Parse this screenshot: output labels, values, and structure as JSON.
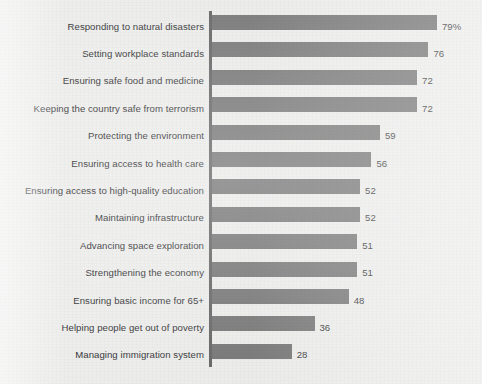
{
  "chart_data": {
    "type": "bar",
    "orientation": "horizontal",
    "title": "",
    "subtitle": "",
    "xlabel": "",
    "ylabel": "",
    "xlim": [
      0,
      79
    ],
    "grid": false,
    "legend": null,
    "value_suffix_first": "%",
    "bar_color": "#6f6f6f",
    "axis_color": "#5d5d5d",
    "background_color": "#ececeb",
    "text_color": "#2b2b2b",
    "categories": [
      "Responding to natural disasters",
      "Setting workplace standards",
      "Ensuring safe food and medicine",
      "Keeping the country safe from terrorism",
      "Protecting the environment",
      "Ensuring access to health care",
      "Ensuring access to high-quality education",
      "Maintaining infrastructure",
      "Advancing space exploration",
      "Strengthening the economy",
      "Ensuring basic income for 65+",
      "Helping people get out of poverty",
      "Managing immigration system"
    ],
    "values": [
      79,
      76,
      72,
      72,
      59,
      56,
      52,
      52,
      51,
      51,
      48,
      36,
      28
    ],
    "value_labels": [
      "79%",
      "76",
      "72",
      "72",
      "59",
      "56",
      "52",
      "52",
      "51",
      "51",
      "48",
      "36",
      "28"
    ]
  }
}
